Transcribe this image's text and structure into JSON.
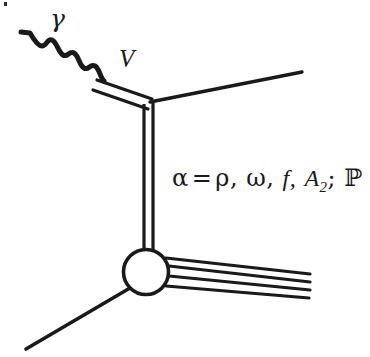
{
  "figure": {
    "background_color": "#ffffff",
    "ink_color": "#1a1a1a",
    "width": 370,
    "height": 357
  },
  "labels": {
    "photon": "γ",
    "vector_meson": "V",
    "exchange_prefix": "α",
    "equals": "=",
    "exchange_rho": "ρ,",
    "exchange_omega": "ω,",
    "exchange_f": "f,",
    "exchange_a": "A",
    "exchange_a_subscript": "2",
    "semicolon": ";",
    "exchange_pomeron": "ℙ"
  },
  "elements": {
    "photon_line": "wavy-photon-line",
    "vector_meson_line": "double-line-vector-meson",
    "exchange_line": "vertical-double-line-reggeon-exchange",
    "blob": "interaction-blob",
    "outgoing_fan": "four-outgoing-hadron-lines",
    "incoming_target": "incoming-target-line",
    "outgoing_upper": "outgoing-upper-right-line"
  },
  "geometry": {
    "blob_center_x": 146,
    "blob_center_y": 272,
    "blob_radius": 23,
    "vertex_x": 152,
    "vertex_y": 101,
    "outgoing_line_count": 4
  }
}
